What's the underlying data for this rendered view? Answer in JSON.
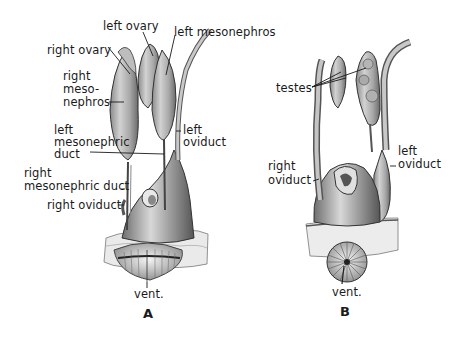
{
  "figure": {
    "panels": [
      {
        "id": "A",
        "letter": "A",
        "labels": {
          "left_ovary": "left ovary",
          "left_mesonephros": "left mesonephros",
          "right_ovary": "right ovary",
          "right_mesonephros_1": "right",
          "right_mesonephros_2": "meso-",
          "right_mesonephros_3": "nephros",
          "left_mesonephric_duct_1": "left",
          "left_mesonephric_duct_2": "mesonephric",
          "left_mesonephric_duct_3": "duct",
          "left_oviduct_1": "left",
          "left_oviduct_2": "oviduct",
          "right_mesonephric_duct_1": "right",
          "right_mesonephric_duct_2": "mesonephric duct",
          "right_oviduct": "right oviduct",
          "vent": "vent."
        }
      },
      {
        "id": "B",
        "letter": "B",
        "labels": {
          "testes": "testes",
          "left_oviduct_1": "left",
          "left_oviduct_2": "oviduct",
          "right_oviduct_1": "right",
          "right_oviduct_2": "oviduct",
          "vent": "vent."
        }
      }
    ],
    "colors": {
      "background": "#ffffff",
      "organ_fill": "#b8b8b8",
      "organ_shade": "#7a7a7a",
      "outline": "#3a3a3a",
      "tissue": "#e6e6e6",
      "text": "#1a1a1a"
    }
  }
}
